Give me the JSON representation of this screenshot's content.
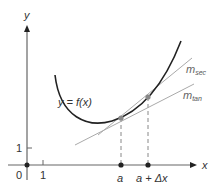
{
  "diagram": {
    "axes": {
      "x_label": "x",
      "y_label": "y",
      "origin_label": "0",
      "x_tick_label": "1",
      "y_tick_label": "1"
    },
    "curve_label": "y = f(x)",
    "points": {
      "a_label": "a",
      "a_dx_label": "a + Δx"
    },
    "lines": {
      "secant": {
        "m": "m",
        "sub": "sec"
      },
      "tangent": {
        "m": "m",
        "sub": "tan"
      }
    },
    "colors": {
      "axis": "#555555",
      "curve": "#222222",
      "secant": "#999999",
      "tangent": "#999999",
      "point": "#777777",
      "dashed": "#888888"
    }
  }
}
